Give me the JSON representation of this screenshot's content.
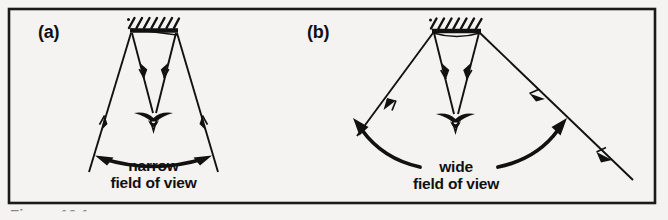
{
  "figure": {
    "background_color": "#f4f3f1",
    "ink_color": "#111111",
    "frame": {
      "name": "figure-border"
    },
    "panels": [
      {
        "id": "a",
        "tag": "(a)",
        "fov_line1": "narrow",
        "fov_line2": "field of view",
        "arrow_style": "double-headed-curved-arrow",
        "ceiling": "hatched-block",
        "viewer": "eye-symbol",
        "ray_count": 4
      },
      {
        "id": "b",
        "tag": "(b)",
        "fov_line1": "wide",
        "fov_line2": "field of view",
        "arrow_style": "two-curved-arrows",
        "ceiling": "hatched-block",
        "viewer": "eye-symbol",
        "ray_count": 4
      }
    ],
    "caption_partial": "Figure 10.1 ..."
  }
}
